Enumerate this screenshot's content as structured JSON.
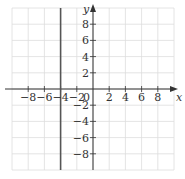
{
  "chart_data": {
    "type": "line",
    "title": "",
    "xlabel": "x",
    "ylabel": "y",
    "xlim": [
      -10,
      10
    ],
    "ylim": [
      -10,
      10
    ],
    "grid": true,
    "grid_step": 2,
    "x_ticks": [
      -8,
      -6,
      -4,
      -2,
      2,
      4,
      6,
      8
    ],
    "x_tick_labels": [
      "−8",
      "−6",
      "−4",
      "−2",
      "2",
      "4",
      "6",
      "8"
    ],
    "y_ticks": [
      8,
      6,
      4,
      2,
      -2,
      -4,
      -6,
      -8
    ],
    "y_tick_labels": [
      "8",
      "6",
      "4",
      "2",
      "−2",
      "−4",
      "−6",
      "−8"
    ],
    "origin_label": "0",
    "series": [
      {
        "name": "x = -4",
        "kind": "vertical_line",
        "x": -4,
        "points": [
          [
            -4,
            -10
          ],
          [
            -4,
            10
          ]
        ],
        "color": "#555555"
      }
    ],
    "colors": {
      "grid": "#dddddd",
      "axis": "#333333",
      "line": "#555555"
    }
  }
}
